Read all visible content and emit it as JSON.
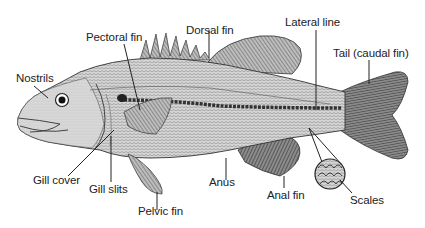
{
  "diagram": {
    "labels": {
      "nostrils": "Nostrils",
      "pectoral_fin": "Pectoral fin",
      "dorsal_fin": "Dorsal fin",
      "lateral_line": "Lateral line",
      "tail": "Tail (caudal fin)",
      "gill_cover": "Gill cover",
      "gill_slits": "Gill slits",
      "pelvic_fin": "Pelvic fin",
      "anus": "Anus",
      "anal_fin": "Anal fin",
      "scales": "Scales"
    },
    "colors": {
      "ink": "#222222",
      "body_fill": "#c8c8c8",
      "fin_fill": "#9a9a9a",
      "tail_fill": "#6e6e6e",
      "background": "#ffffff"
    }
  }
}
